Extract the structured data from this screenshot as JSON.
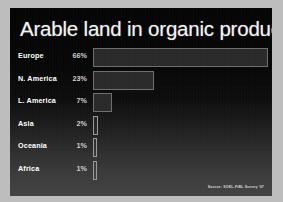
{
  "slide": {
    "title": "Arable land in organic production",
    "source": "Source: SOEL-FiBL Survey '07",
    "colors": {
      "slide_background": "#0a0a0a",
      "page_margin": "#bdbdbd",
      "title_text": "#f2f2f2",
      "label_text": "#ffffff",
      "value_text": "#cfcfcf",
      "bar_fill": "#2a2a2a",
      "bar_stroke": "#6e6e6e"
    }
  },
  "chart_data": {
    "type": "bar",
    "title": "Arable land in organic production",
    "xlabel": "",
    "ylabel": "",
    "orientation": "horizontal",
    "grid": false,
    "legend": false,
    "xlim": [
      0,
      70
    ],
    "categories": [
      "Europe",
      "N. America",
      "L. America",
      "Asia",
      "Oceania",
      "Africa"
    ],
    "values": [
      66,
      23,
      7,
      2,
      1,
      1
    ],
    "value_labels": [
      "66%",
      "23%",
      "7%",
      "2%",
      "1%",
      "1%"
    ],
    "units": "percent",
    "annotations": [
      "Source: SOEL-FiBL Survey '07"
    ]
  }
}
